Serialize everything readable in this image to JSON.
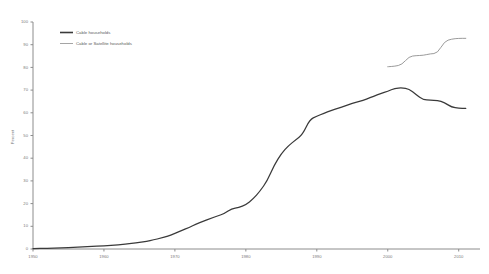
{
  "chart_data": {
    "type": "line",
    "title": "",
    "xlabel": "",
    "ylabel": "Percent",
    "xlim": [
      1950,
      2013
    ],
    "ylim": [
      0,
      100
    ],
    "grid": false,
    "legend_position": "top-left",
    "xticks": [
      1950,
      1960,
      1970,
      1980,
      1990,
      2000,
      2010
    ],
    "xtick_labels": [
      "1950",
      "1960",
      "1970",
      "1980",
      "1990",
      "2000",
      "2010"
    ],
    "yticks": [
      0,
      10,
      20,
      30,
      40,
      50,
      60,
      70,
      80,
      90,
      100
    ],
    "ytick_labels": [
      "0",
      "10",
      "20",
      "30",
      "40",
      "50",
      "60",
      "70",
      "80",
      "90",
      "100"
    ],
    "series": [
      {
        "name": "Cable households",
        "color": "#3a3a3a",
        "x": [
          1950,
          1952,
          1954,
          1956,
          1958,
          1960,
          1962,
          1964,
          1965,
          1966,
          1967,
          1968,
          1969,
          1970,
          1971,
          1972,
          1973,
          1974,
          1975,
          1976,
          1977,
          1978,
          1979,
          1980,
          1981,
          1982,
          1983,
          1984,
          1985,
          1986,
          1987,
          1988,
          1989,
          1990,
          1991,
          1992,
          1993,
          1994,
          1995,
          1996,
          1997,
          1998,
          1999,
          2000,
          2001,
          2002,
          2003,
          2004,
          2005,
          2006,
          2007,
          2008,
          2009,
          2010,
          2011
        ],
        "y": [
          0.2,
          0.3,
          0.5,
          0.8,
          1.1,
          1.4,
          1.8,
          2.4,
          2.9,
          3.4,
          4.0,
          4.8,
          5.6,
          6.9,
          8.2,
          9.5,
          11.0,
          12.2,
          13.4,
          14.6,
          15.6,
          17.8,
          18.3,
          19.5,
          22.0,
          25.5,
          30.0,
          37.0,
          42.0,
          45.5,
          48.0,
          50.5,
          57.0,
          58.5,
          59.8,
          61.0,
          62.0,
          63.0,
          64.2,
          65.0,
          66.0,
          67.3,
          68.5,
          69.5,
          70.8,
          71.0,
          70.6,
          68.0,
          65.8,
          65.5,
          65.5,
          64.5,
          62.5,
          62.0,
          62.0
        ]
      },
      {
        "name": "Cable or Satellite households",
        "color": "#8e8e8e",
        "x": [
          2000,
          2001,
          2002,
          2003,
          2004,
          2005,
          2006,
          2007,
          2008,
          2009,
          2010,
          2011
        ],
        "y": [
          80.3,
          80.5,
          81.2,
          84.8,
          85.2,
          85.3,
          86.0,
          86.2,
          91.5,
          92.5,
          92.8,
          92.8
        ]
      }
    ]
  },
  "legend": {
    "items": [
      {
        "label": "Cable households"
      },
      {
        "label": "Cable or Satellite households"
      }
    ]
  }
}
